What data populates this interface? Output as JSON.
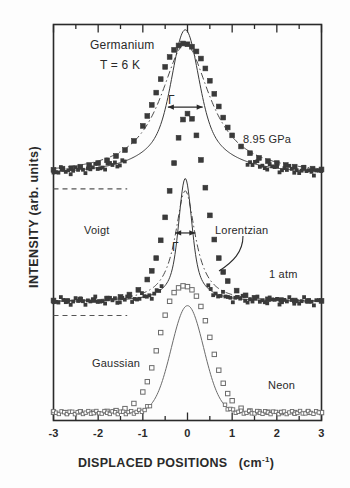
{
  "figure": {
    "kind": "raman-spectrum-plot",
    "background": "#fdfdfd",
    "ink": "#2a2a2a"
  },
  "axes": {
    "xlabel_main": "DISPLACED POSITIONS",
    "xlabel_units": "(cm",
    "xlabel_units_exp": "-1",
    "xlabel_units_close": ")",
    "ylabel": "INTENSITY   (arb. units)",
    "xticklabels": [
      "-3",
      "-2",
      "-1",
      "0",
      "1",
      "2",
      "3"
    ]
  },
  "annotations": {
    "sample": "Germanium",
    "temperature": "T = 6 K",
    "pressure_top": "8.95 GPa",
    "pressure_mid": "1 atm",
    "reference": "Neon",
    "fit_voigt": "Voigt",
    "fit_lorentzian": "Lorentzian",
    "fit_gaussian": "Gaussian",
    "width_symbol_top": "Γ",
    "width_symbol_mid": "Γ"
  },
  "chart_data": {
    "type": "line",
    "xlabel": "DISPLACED POSITIONS (cm-1)",
    "ylabel": "INTENSITY (arb. units)",
    "xlim": [
      -3,
      3
    ],
    "ylim": [
      0,
      1
    ],
    "grid": false,
    "legend_position": "inline-annotations",
    "xticks": [
      -3,
      -2,
      -1,
      0,
      1,
      2,
      3
    ],
    "minor_ticks_per_interval": 1,
    "series": [
      {
        "name": "8.95 GPa",
        "marker": "filled-square",
        "marker_color": "#3a3a3a",
        "line": "solid",
        "baseline_offset": 0.62,
        "peak_amplitude": 0.33,
        "peak_center": -0.05,
        "profile": "voigt",
        "gaussian_fwhm": 0.62,
        "lorentzian_fwhm": 1.35,
        "gamma_marked": 0.78,
        "x": [
          -3.0,
          -2.8,
          -2.6,
          -2.4,
          -2.2,
          -2.0,
          -1.8,
          -1.6,
          -1.4,
          -1.2,
          -1.0,
          -0.9,
          -0.8,
          -0.7,
          -0.6,
          -0.5,
          -0.4,
          -0.3,
          -0.2,
          -0.1,
          0.0,
          0.1,
          0.2,
          0.3,
          0.4,
          0.5,
          0.6,
          0.7,
          0.8,
          0.9,
          1.0,
          1.2,
          1.4,
          1.6,
          1.8,
          2.0,
          2.2,
          2.4,
          2.6,
          2.8,
          3.0
        ],
        "y": [
          0.633,
          0.636,
          0.637,
          0.641,
          0.645,
          0.65,
          0.657,
          0.668,
          0.683,
          0.706,
          0.744,
          0.769,
          0.797,
          0.828,
          0.862,
          0.893,
          0.918,
          0.936,
          0.947,
          0.952,
          0.95,
          0.944,
          0.932,
          0.914,
          0.889,
          0.858,
          0.825,
          0.793,
          0.765,
          0.74,
          0.72,
          0.692,
          0.675,
          0.663,
          0.655,
          0.65,
          0.645,
          0.641,
          0.638,
          0.636,
          0.634
        ]
      },
      {
        "name": "1 atm",
        "marker": "filled-square",
        "marker_color": "#3a3a3a",
        "line": "solid",
        "baseline_offset": 0.3,
        "peak_amplitude": 0.28,
        "peak_center": -0.05,
        "profile": "voigt",
        "gaussian_fwhm": 0.3,
        "lorentzian_fwhm": 0.55,
        "gamma_marked": 0.45,
        "x": [
          -3.0,
          -2.7,
          -2.4,
          -2.1,
          -1.8,
          -1.5,
          -1.3,
          -1.1,
          -0.9,
          -0.8,
          -0.7,
          -0.6,
          -0.5,
          -0.4,
          -0.3,
          -0.2,
          -0.1,
          0.0,
          0.1,
          0.2,
          0.3,
          0.4,
          0.5,
          0.6,
          0.7,
          0.8,
          0.9,
          1.1,
          1.3,
          1.5,
          1.8,
          2.1,
          2.4,
          2.7,
          3.0
        ],
        "y": [
          0.303,
          0.302,
          0.305,
          0.304,
          0.308,
          0.312,
          0.318,
          0.33,
          0.356,
          0.378,
          0.41,
          0.455,
          0.513,
          0.58,
          0.65,
          0.714,
          0.76,
          0.775,
          0.762,
          0.72,
          0.658,
          0.588,
          0.518,
          0.457,
          0.41,
          0.375,
          0.352,
          0.328,
          0.316,
          0.31,
          0.306,
          0.304,
          0.303,
          0.302,
          0.302
        ]
      },
      {
        "name": "Neon",
        "marker": "open-square",
        "marker_color": "#6b6b6b",
        "line": "solid",
        "baseline_offset": 0.02,
        "peak_amplitude": 0.27,
        "peak_center": 0.0,
        "profile": "gaussian",
        "gaussian_fwhm": 0.85,
        "x": [
          -3.0,
          -2.7,
          -2.4,
          -2.1,
          -1.8,
          -1.6,
          -1.4,
          -1.2,
          -1.0,
          -0.9,
          -0.8,
          -0.7,
          -0.6,
          -0.5,
          -0.4,
          -0.3,
          -0.2,
          -0.1,
          0.0,
          0.1,
          0.2,
          0.3,
          0.4,
          0.5,
          0.6,
          0.7,
          0.8,
          0.9,
          1.0,
          1.2,
          1.4,
          1.6,
          1.8,
          2.1,
          2.4,
          2.7,
          3.0
        ],
        "y": [
          0.021,
          0.02,
          0.022,
          0.021,
          0.023,
          0.025,
          0.03,
          0.043,
          0.072,
          0.098,
          0.133,
          0.176,
          0.222,
          0.266,
          0.301,
          0.323,
          0.335,
          0.34,
          0.338,
          0.33,
          0.314,
          0.288,
          0.252,
          0.21,
          0.167,
          0.127,
          0.094,
          0.068,
          0.05,
          0.031,
          0.024,
          0.022,
          0.021,
          0.02,
          0.02,
          0.021,
          0.02
        ]
      }
    ],
    "fit_overlays": [
      {
        "name": "Lorentzian fit (8.95 GPa)",
        "style": "dash-dot",
        "for_series": "8.95 GPa"
      },
      {
        "name": "Lorentzian fit (1 atm)",
        "style": "dash-dot",
        "for_series": "1 atm"
      }
    ],
    "baselines": [
      {
        "for_series": "8.95 GPa",
        "style": "dashed",
        "x_extent": [
          -3.0,
          -1.35
        ]
      },
      {
        "for_series": "1 atm",
        "style": "dashed",
        "x_extent": [
          -3.0,
          -1.35
        ]
      }
    ]
  }
}
